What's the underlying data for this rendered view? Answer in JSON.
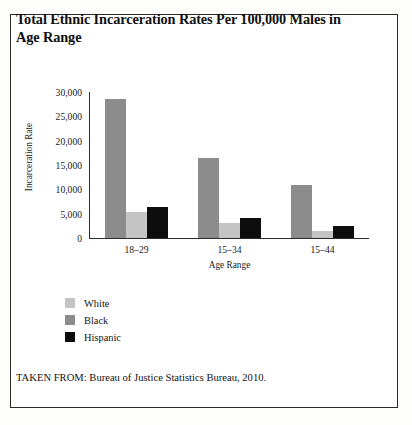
{
  "chart_data": {
    "type": "bar",
    "title": "Total Ethnic Incarceration Rates Per 100,000 Males in Age Range",
    "xlabel": "Age Range",
    "ylabel": "Incarceration Rate",
    "categories": [
      "18–29",
      "15–34",
      "15–44"
    ],
    "ylim": [
      0,
      30000
    ],
    "yticks": [
      {
        "value": 30000,
        "label": "30,000"
      },
      {
        "value": 25000,
        "label": "25,000"
      },
      {
        "value": 20000,
        "label": "20,000"
      },
      {
        "value": 15000,
        "label": "15,000"
      },
      {
        "value": 10000,
        "label": "10,000"
      },
      {
        "value": 5000,
        "label": "5,000"
      },
      {
        "value": 0,
        "label": "0"
      }
    ],
    "grid": false,
    "legend_position": "below-left",
    "series": [
      {
        "name": "Black",
        "color": "#8c8c8c",
        "values": [
          28500,
          16500,
          10800
        ]
      },
      {
        "name": "White",
        "color": "#c4c4c4",
        "values": [
          5400,
          3100,
          1500
        ]
      },
      {
        "name": "Hispanic",
        "color": "#0d0d0d",
        "values": [
          6400,
          4200,
          2500
        ]
      }
    ],
    "legend_order": [
      "White",
      "Black",
      "Hispanic"
    ],
    "source": "TAKEN FROM: Bureau of Justice Statistics Bureau, 2010."
  }
}
